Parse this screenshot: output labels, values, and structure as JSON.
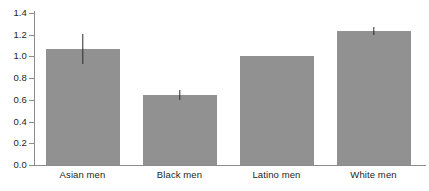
{
  "chart_data": {
    "type": "bar",
    "title": "",
    "subtitle": "",
    "xlabel": "",
    "ylabel": "",
    "categories": [
      "Asian men",
      "Black men",
      "Latino men",
      "White men"
    ],
    "values": [
      1.07,
      0.645,
      1.005,
      1.235
    ],
    "errors": [
      0.14,
      0.05,
      0.0,
      0.04
    ],
    "error_bar_style": "plain-line-no-caps",
    "ylim": [
      0.0,
      1.4
    ],
    "ytick_labels": [
      "0.0",
      "0.2",
      "0.4",
      "0.6",
      "0.8",
      "1.0",
      "1.2",
      "1.4"
    ],
    "ytick_values": [
      0.0,
      0.2,
      0.4,
      0.6,
      0.8,
      1.0,
      1.2,
      1.4
    ],
    "grid": false,
    "legend": null,
    "legend_position": "none",
    "annotations": [],
    "colors": {
      "bar_fill": "#919191",
      "error_bar": "#2b2b2b",
      "axis": "#8c8c8c",
      "text": "#231f20",
      "background": "#ffffff"
    }
  }
}
